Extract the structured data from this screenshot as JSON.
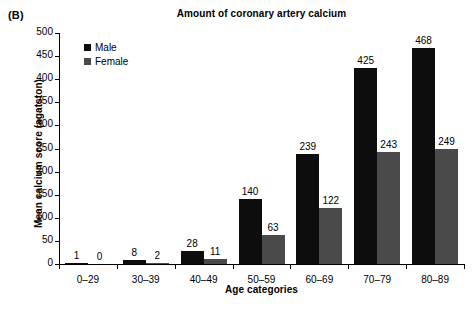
{
  "panel_label": "(B)",
  "chart_data": {
    "type": "bar",
    "title": "Amount of coronary artery calcium",
    "xlabel": "Age categories",
    "ylabel": "Mean calcium score (agatston)",
    "ylim": [
      0,
      500
    ],
    "ytick_step": 50,
    "yticks": [
      0,
      50,
      100,
      150,
      200,
      250,
      300,
      350,
      400,
      450,
      500
    ],
    "grid": false,
    "legend_position": "top-left-inside",
    "categories": [
      "0–29",
      "30–39",
      "40–49",
      "50–59",
      "60–69",
      "70–79",
      "80–89"
    ],
    "series": [
      {
        "name": "Male",
        "color": "#0d0d0d",
        "values": [
          1,
          8,
          28,
          140,
          239,
          425,
          468
        ]
      },
      {
        "name": "Female",
        "color": "#4a4a4a",
        "values": [
          0,
          2,
          11,
          63,
          122,
          243,
          249
        ]
      }
    ],
    "data_labels": [
      [
        "1",
        "0"
      ],
      [
        "8",
        "2"
      ],
      [
        "28",
        "11"
      ],
      [
        "140",
        "63"
      ],
      [
        "239",
        "122"
      ],
      [
        "425",
        "243"
      ],
      [
        "468",
        "249"
      ]
    ]
  }
}
